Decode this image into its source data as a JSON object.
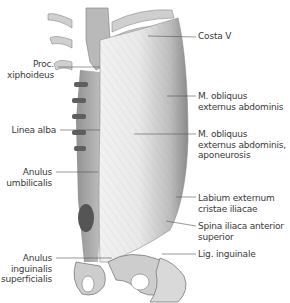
{
  "figure": {
    "labels_left": [
      {
        "id": "proc-xiphoideus",
        "lines": [
          "Proc.",
          "xiphoideus"
        ]
      },
      {
        "id": "linea-alba",
        "lines": [
          "Linea alba"
        ]
      },
      {
        "id": "anulus-umbilicalis",
        "lines": [
          "Anulus",
          "umbilicalis"
        ]
      },
      {
        "id": "anulus-inguinalis-superficialis",
        "lines": [
          "Anulus",
          "inguinalis",
          "superficialis"
        ]
      }
    ],
    "labels_right": [
      {
        "id": "costa-v",
        "lines": [
          "Costa V"
        ]
      },
      {
        "id": "m-obliquus-externus",
        "lines": [
          "M. obliquus",
          "externus abdominis"
        ]
      },
      {
        "id": "m-obliquus-aponeurosis",
        "lines": [
          "M. obliquus",
          "externus abdominis,",
          "aponeurosis"
        ]
      },
      {
        "id": "labium-externum",
        "lines": [
          "Labium externum",
          "cristae iliacae"
        ]
      },
      {
        "id": "spina-iliaca",
        "lines": [
          "Spina iliaca anterior",
          "superior"
        ]
      },
      {
        "id": "lig-inguinale",
        "lines": [
          "Lig. inguinale"
        ]
      }
    ]
  }
}
